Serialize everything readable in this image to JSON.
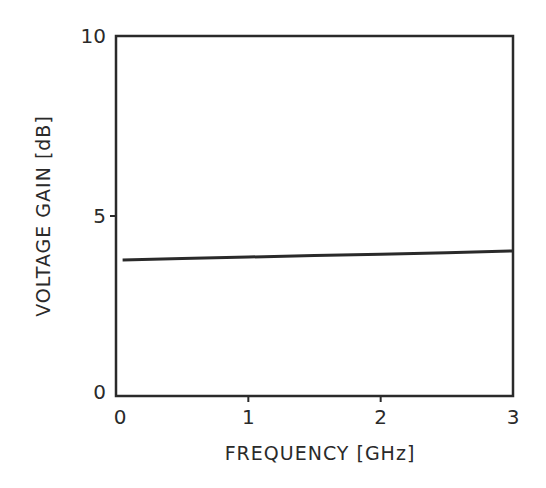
{
  "chart_data": {
    "type": "line",
    "title": "",
    "xlabel": "FREQUENCY [GHz]",
    "ylabel": "VOLTAGE GAIN [dB]",
    "xlim": [
      0,
      3
    ],
    "ylim": [
      0,
      10
    ],
    "xticks": [
      "0",
      "1",
      "2",
      "3"
    ],
    "yticks": [
      "0",
      "5",
      "10"
    ],
    "grid": false,
    "legend": null,
    "series": [
      {
        "name": "Voltage Gain",
        "x": [
          0.05,
          0.5,
          1.0,
          1.5,
          2.0,
          2.5,
          3.0
        ],
        "y": [
          3.78,
          3.82,
          3.86,
          3.9,
          3.94,
          3.98,
          4.03
        ]
      }
    ]
  },
  "colors": {
    "ink": "#2a2a2a",
    "background": "#ffffff"
  }
}
